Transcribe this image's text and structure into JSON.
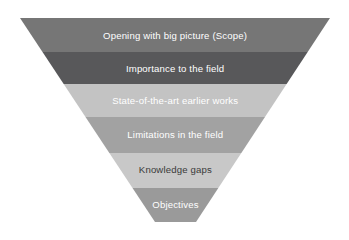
{
  "diagram": {
    "type": "inverted-funnel",
    "background_color": "#ffffff",
    "geometry": {
      "top_left_x": 20,
      "top_right_x": 330,
      "top_y": 18,
      "bottom_y": 222,
      "bottom_left_x": 155,
      "bottom_right_x": 196
    },
    "bands": [
      {
        "label": "Opening with big picture (Scope)",
        "fill": "#767676",
        "text_color": "#ffffff",
        "y_top": 18,
        "y_bottom": 52,
        "text_y": 36
      },
      {
        "label": "Importance to the field",
        "fill": "#58585a",
        "text_color": "#ffffff",
        "y_top": 52,
        "y_bottom": 84,
        "text_y": 69
      },
      {
        "label": "State-of-the-art earlier works",
        "fill": "#c3c3c3",
        "text_color": "#ffffff",
        "y_top": 84,
        "y_bottom": 117,
        "text_y": 101
      },
      {
        "label": "Limitations in the field",
        "fill": "#a2a2a2",
        "text_color": "#ffffff",
        "y_top": 117,
        "y_bottom": 153,
        "text_y": 135
      },
      {
        "label": "Knowledge gaps",
        "fill": "#c8c8c8",
        "text_color": "#3a3a3a",
        "y_top": 153,
        "y_bottom": 188,
        "text_y": 170
      },
      {
        "label": "Objectives",
        "fill": "#9a9a9a",
        "text_color": "#ffffff",
        "y_top": 188,
        "y_bottom": 222,
        "text_y": 205
      }
    ]
  }
}
